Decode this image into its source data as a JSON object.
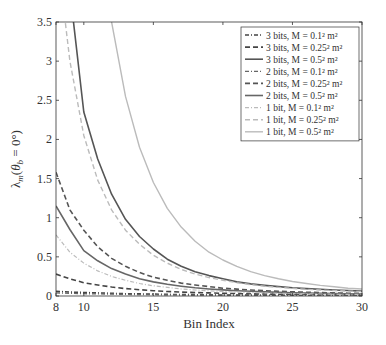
{
  "chart_data": {
    "type": "line",
    "title": "",
    "xlabel": "Bin Index",
    "ylabel": "λ_m(θ_b = 0°)",
    "xlim": [
      8,
      30
    ],
    "ylim": [
      0,
      3.5
    ],
    "xticks": [
      8,
      10,
      15,
      20,
      25,
      30
    ],
    "yticks": [
      0,
      0.5,
      1,
      1.5,
      2,
      2.5,
      3,
      3.5
    ],
    "grid": false,
    "legend_position": "upper right",
    "x": [
      8,
      9,
      10,
      11,
      12,
      13,
      14,
      15,
      16,
      17,
      18,
      19,
      20,
      21,
      22,
      23,
      24,
      25,
      26,
      27,
      28,
      29,
      30
    ],
    "series": [
      {
        "name": "3 bits, M = 0.1² m²",
        "style": "dashdot",
        "color": "#444444",
        "width": 1.6,
        "values": [
          0.06,
          0.05,
          0.045,
          0.04,
          0.035,
          0.03,
          0.027,
          0.024,
          0.021,
          0.019,
          0.017,
          0.015,
          0.013,
          0.012,
          0.011,
          0.01,
          0.009,
          0.008,
          0.007,
          0.007,
          0.006,
          0.006,
          0.005
        ]
      },
      {
        "name": "3 bits, M = 0.25² m²",
        "style": "dashed",
        "color": "#444444",
        "width": 1.6,
        "values": [
          0.28,
          0.22,
          0.17,
          0.14,
          0.115,
          0.095,
          0.08,
          0.068,
          0.058,
          0.05,
          0.044,
          0.039,
          0.035,
          0.031,
          0.028,
          0.025,
          0.023,
          0.021,
          0.019,
          0.017,
          0.016,
          0.015,
          0.014
        ]
      },
      {
        "name": "3 bits, M = 0.5² m²",
        "style": "solid",
        "color": "#555555",
        "width": 1.6,
        "values": [
          5.2,
          3.9,
          2.35,
          1.75,
          1.3,
          0.98,
          0.76,
          0.6,
          0.47,
          0.38,
          0.31,
          0.26,
          0.22,
          0.18,
          0.155,
          0.135,
          0.12,
          0.105,
          0.095,
          0.085,
          0.077,
          0.07,
          0.063
        ]
      },
      {
        "name": "2 bits, M = 0.1² m²",
        "style": "dashdot",
        "color": "#666666",
        "width": 1.3,
        "values": [
          0.04,
          0.035,
          0.03,
          0.027,
          0.024,
          0.021,
          0.018,
          0.016,
          0.014,
          0.013,
          0.012,
          0.011,
          0.01,
          0.009,
          0.008,
          0.008,
          0.007,
          0.007,
          0.006,
          0.006,
          0.005,
          0.005,
          0.005
        ]
      },
      {
        "name": "2 bits, M = 0.25² m²",
        "style": "dashed",
        "color": "#555555",
        "width": 1.6,
        "values": [
          1.58,
          1.1,
          0.84,
          0.63,
          0.48,
          0.38,
          0.3,
          0.24,
          0.2,
          0.165,
          0.14,
          0.12,
          0.1,
          0.088,
          0.077,
          0.068,
          0.06,
          0.054,
          0.048,
          0.044,
          0.04,
          0.036,
          0.033
        ]
      },
      {
        "name": "2 bits, M = 0.5² m²",
        "style": "solid",
        "color": "#666666",
        "width": 1.6,
        "values": [
          1.15,
          0.85,
          0.58,
          0.45,
          0.35,
          0.28,
          0.22,
          0.18,
          0.15,
          0.125,
          0.105,
          0.09,
          0.078,
          0.068,
          0.06,
          0.053,
          0.047,
          0.042,
          0.038,
          0.034,
          0.031,
          0.028,
          0.026
        ]
      },
      {
        "name": "1 bit, M = 0.1² m²",
        "style": "dashdot",
        "color": "#bbbbbb",
        "width": 1.2,
        "values": [
          0.78,
          0.56,
          0.42,
          0.32,
          0.25,
          0.2,
          0.16,
          0.13,
          0.11,
          0.09,
          0.077,
          0.066,
          0.057,
          0.05,
          0.044,
          0.039,
          0.035,
          0.031,
          0.028,
          0.025,
          0.023,
          0.021,
          0.019
        ]
      },
      {
        "name": "1 bit, M = 0.25² m²",
        "style": "dashed",
        "color": "#bbbbbb",
        "width": 1.4,
        "values": [
          4.5,
          3.0,
          2.05,
          1.48,
          1.1,
          0.84,
          0.66,
          0.52,
          0.42,
          0.34,
          0.28,
          0.235,
          0.2,
          0.17,
          0.145,
          0.125,
          0.11,
          0.097,
          0.086,
          0.077,
          0.069,
          0.062,
          0.056
        ]
      },
      {
        "name": "1 bit, M = 0.5² m²",
        "style": "solid",
        "color": "#bbbbbb",
        "width": 1.4,
        "values": [
          12.0,
          8.5,
          6.2,
          4.6,
          3.5,
          2.55,
          1.9,
          1.45,
          1.12,
          0.88,
          0.7,
          0.56,
          0.46,
          0.38,
          0.31,
          0.26,
          0.22,
          0.185,
          0.16,
          0.135,
          0.117,
          0.1,
          0.09
        ]
      }
    ]
  }
}
